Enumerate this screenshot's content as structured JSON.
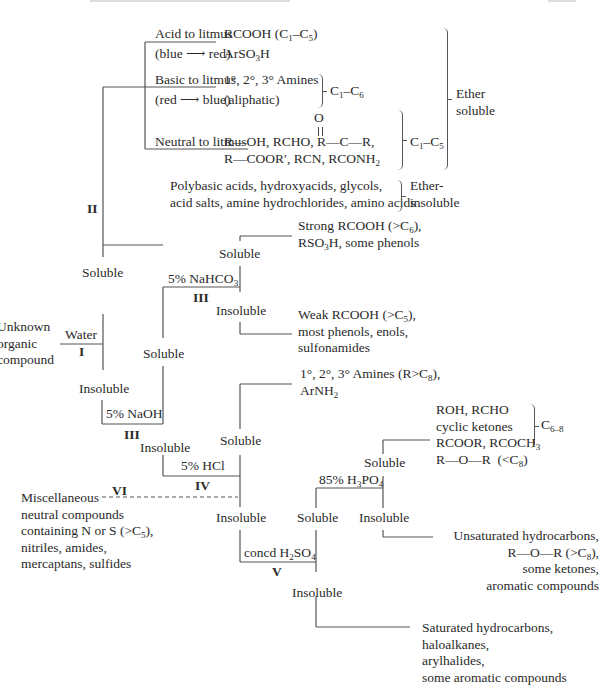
{
  "diagram": {
    "start_node": {
      "label_lines": [
        "Unknown",
        "organic",
        "compound"
      ]
    },
    "tests": {
      "I": {
        "reagent": "Water",
        "numeral": "I"
      },
      "II": {
        "reagent": "Ether",
        "numeral": "II"
      },
      "III_bicarb": {
        "reagent": "5% NaHCO₃",
        "numeral": "III"
      },
      "III_naoh": {
        "reagent": "5% NaOH",
        "numeral": "III"
      },
      "IV": {
        "reagent": "5% HCl",
        "numeral": "IV"
      },
      "V": {
        "reagent": "concd H₂SO₄",
        "numeral": "V"
      },
      "VI": {
        "numeral": "VI"
      },
      "phosphoric": {
        "reagent": "85% H₃PO₄"
      }
    },
    "outcome_labels": {
      "soluble": "Soluble",
      "insoluble": "Insoluble"
    },
    "ether_soluble_group": {
      "brace_label_lines": [
        "Ether",
        "soluble"
      ],
      "acid": {
        "condition_lines": [
          "Acid to litmus",
          "(blue ⟶ red)"
        ],
        "compounds": [
          "RCOOH (C₁–C₅)",
          "ArSO₃H"
        ]
      },
      "basic": {
        "condition_lines": [
          "Basic to litmus",
          "(red ⟶ blue)"
        ],
        "compounds": [
          "1°, 2°, 3° Amines",
          "(aliphatic)"
        ],
        "range": "C₁–C₆"
      },
      "neutral": {
        "condition_lines": [
          "Neutral to litmus"
        ],
        "carbonyl_o": "O",
        "compounds": [
          "R—OH, RCHO, R—C—R,",
          "R—COOR′, RCN, RCONH₂"
        ],
        "range": "C₁–C₅"
      }
    },
    "ether_insoluble_group": {
      "compounds": [
        "Polybasic acids, hydroxyacids, glycols,",
        "acid salts, amine hydrochlorides, amino acids"
      ],
      "brace_label_lines": [
        "Ether-",
        "insoluble"
      ]
    },
    "bicarb_soluble": [
      "Strong RCOOH (>C₆),",
      "RSO₃H, some phenols"
    ],
    "bicarb_insoluble": [
      "Weak RCOOH (>C₅),",
      "most phenols, enols,",
      "sulfonamides"
    ],
    "hcl_soluble": [
      "1°, 2°, 3° Amines (R>C₈),",
      "ArNH₂"
    ],
    "misc_neutral": [
      "Miscellaneous",
      "neutral compounds",
      "containing N or S (>C₅),",
      "nitriles, amides,",
      "mercaptans, sulfides"
    ],
    "phosphoric_soluble": {
      "compounds": [
        "ROH, RCHO",
        "cyclic ketones",
        "RCOOR, RCOCH₃",
        "R—O—R  (<C₈)"
      ],
      "range": "C₆₋₈"
    },
    "phosphoric_insoluble": [
      "Unsaturated hydrocarbons,",
      "R—O—R (>C₈),",
      "some ketones,",
      "aromatic compounds"
    ],
    "sulfuric_insoluble": [
      "Saturated hydrocarbons,",
      "haloalkanes,",
      "arylhalides,",
      "some aromatic compounds"
    ]
  }
}
